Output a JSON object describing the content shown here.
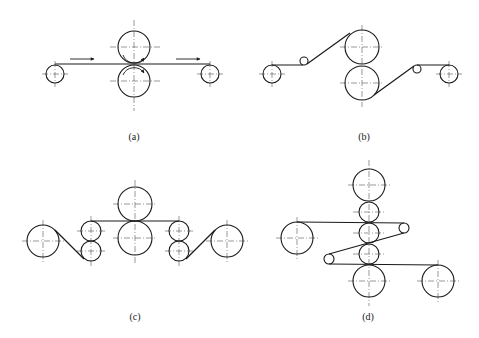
{
  "figure": {
    "panels": [
      {
        "id": "a",
        "label": "(a)",
        "label_pos": [
          134,
          132
        ],
        "rollers": [
          {
            "name": "pay-off-roll",
            "cx": 55,
            "cy": 74,
            "r": 9
          },
          {
            "name": "upper-work-roll",
            "cx": 134,
            "cy": 47,
            "r": 16
          },
          {
            "name": "lower-work-roll",
            "cx": 134,
            "cy": 81,
            "r": 16
          },
          {
            "name": "take-up-roll",
            "cx": 210,
            "cy": 74,
            "r": 9
          }
        ],
        "strip": [
          [
            55,
            64
          ],
          [
            210,
            64
          ]
        ],
        "flow_arrows": [
          [
            70,
            59,
            94,
            59
          ],
          [
            176,
            59,
            200,
            59
          ]
        ],
        "rotation_arrows": true
      },
      {
        "id": "b",
        "label": "(b)",
        "label_pos": [
          364,
          132
        ],
        "rollers": [
          {
            "name": "pay-off-roll",
            "cx": 272,
            "cy": 74,
            "r": 9
          },
          {
            "name": "idler-left",
            "cx": 304,
            "cy": 61,
            "r": 4
          },
          {
            "name": "upper-work-roll",
            "cx": 362,
            "cy": 47,
            "r": 17
          },
          {
            "name": "lower-work-roll",
            "cx": 362,
            "cy": 83,
            "r": 17
          },
          {
            "name": "idler-right",
            "cx": 417,
            "cy": 69,
            "r": 4
          },
          {
            "name": "take-up-roll",
            "cx": 449,
            "cy": 74,
            "r": 9
          }
        ],
        "strip": [
          [
            272,
            65
          ],
          [
            302,
            65
          ],
          [
            352,
            32
          ],
          [
            362,
            47
          ],
          [
            374,
            96
          ],
          [
            414,
            66
          ],
          [
            417,
            65
          ],
          [
            449,
            65
          ]
        ]
      },
      {
        "id": "c",
        "label": "(c)",
        "label_pos": [
          135,
          312
        ],
        "rollers": [
          {
            "name": "pay-off-roll",
            "cx": 43,
            "cy": 241,
            "r": 16
          },
          {
            "name": "pinch-left-upper",
            "cx": 91,
            "cy": 231,
            "r": 10
          },
          {
            "name": "pinch-left-lower",
            "cx": 91,
            "cy": 251,
            "r": 10
          },
          {
            "name": "upper-work-roll",
            "cx": 135,
            "cy": 204,
            "r": 17
          },
          {
            "name": "lower-work-roll",
            "cx": 135,
            "cy": 238,
            "r": 17
          },
          {
            "name": "pinch-right-upper",
            "cx": 179,
            "cy": 231,
            "r": 10
          },
          {
            "name": "pinch-right-lower",
            "cx": 179,
            "cy": 251,
            "r": 10
          },
          {
            "name": "take-up-roll",
            "cx": 227,
            "cy": 241,
            "r": 16
          }
        ],
        "strip": [
          [
            56,
            231
          ],
          [
            84,
            259
          ],
          [
            91,
            221
          ],
          [
            179,
            221
          ],
          [
            186,
            259
          ],
          [
            214,
            231
          ]
        ]
      },
      {
        "id": "d",
        "label": "(d)",
        "label_pos": [
          368,
          312
        ],
        "rollers": [
          {
            "name": "pay-off-roll",
            "cx": 297,
            "cy": 238,
            "r": 16
          },
          {
            "name": "stack-top-backup",
            "cx": 369,
            "cy": 185,
            "r": 16
          },
          {
            "name": "stack-roll-2",
            "cx": 369,
            "cy": 212,
            "r": 10
          },
          {
            "name": "stack-roll-3",
            "cx": 369,
            "cy": 233,
            "r": 10
          },
          {
            "name": "stack-roll-4",
            "cx": 369,
            "cy": 254,
            "r": 10
          },
          {
            "name": "stack-bottom-backup",
            "cx": 369,
            "cy": 281,
            "r": 16
          },
          {
            "name": "idler-right",
            "cx": 404,
            "cy": 228,
            "r": 5
          },
          {
            "name": "idler-left",
            "cx": 329,
            "cy": 259,
            "r": 5
          },
          {
            "name": "take-up-roll",
            "cx": 438,
            "cy": 281,
            "r": 16
          }
        ]
      }
    ]
  }
}
